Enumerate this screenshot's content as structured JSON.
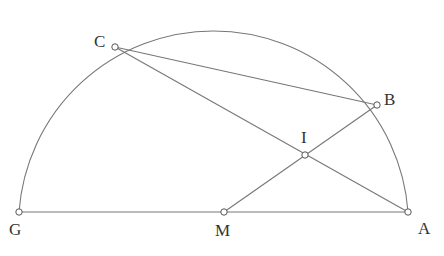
{
  "diagram": {
    "type": "geometry",
    "arc": {
      "name": "semicircle",
      "from": "G",
      "to": "A",
      "center": "M"
    },
    "points": {
      "C": {
        "label": "C",
        "x": 115,
        "y": 47
      },
      "B": {
        "label": "B",
        "x": 377,
        "y": 105
      },
      "I": {
        "label": "I",
        "x": 305,
        "y": 155
      },
      "G": {
        "label": "G",
        "x": 19,
        "y": 212
      },
      "M": {
        "label": "M",
        "x": 224,
        "y": 212
      },
      "A": {
        "label": "A",
        "x": 408,
        "y": 212
      }
    },
    "segments": [
      [
        "G",
        "A"
      ],
      [
        "C",
        "B"
      ],
      [
        "C",
        "A"
      ],
      [
        "M",
        "B"
      ]
    ]
  }
}
